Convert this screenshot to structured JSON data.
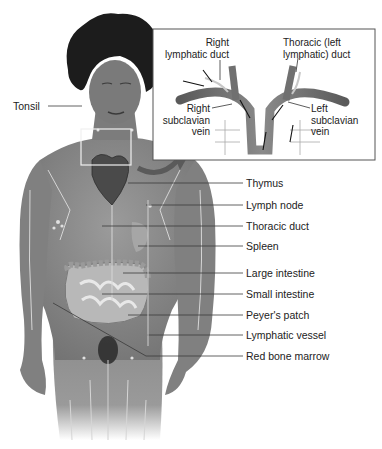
{
  "figure": {
    "colors": {
      "background": "#ffffff",
      "skin": "#8a8a8a",
      "skin_dark": "#5e5e5e",
      "hair": "#1c1c1c",
      "vessel": "#d8d8d8",
      "leader": "#3a3a3a",
      "vein": "#6a6a6a",
      "inset_border": "#555555"
    },
    "labels_left": {
      "tonsil": "Tonsil"
    },
    "labels_right": [
      {
        "id": "thymus",
        "text": "Thymus"
      },
      {
        "id": "lymph-node",
        "text": "Lymph node"
      },
      {
        "id": "thoracic-duct",
        "text": "Thoracic duct"
      },
      {
        "id": "spleen",
        "text": "Spleen"
      },
      {
        "id": "large-intestine",
        "text": "Large intestine"
      },
      {
        "id": "small-intestine",
        "text": "Small intestine"
      },
      {
        "id": "peyers-patch",
        "text": "Peyer's patch"
      },
      {
        "id": "lymphatic-vessel",
        "text": "Lymphatic vessel"
      },
      {
        "id": "red-bone-marrow",
        "text": "Red bone marrow"
      }
    ],
    "inset": {
      "right_lymphatic_duct_line1": "Right",
      "right_lymphatic_duct_line2": "lymphatic duct",
      "thoracic_left_duct_line1": "Thoracic (left",
      "thoracic_left_duct_line2": "lymphatic) duct",
      "right_subclavian_line1": "Right",
      "right_subclavian_line2": "subclavian",
      "right_subclavian_line3": "vein",
      "left_subclavian_line1": "Left",
      "left_subclavian_line2": "subclavian",
      "left_subclavian_line3": "vein"
    }
  }
}
